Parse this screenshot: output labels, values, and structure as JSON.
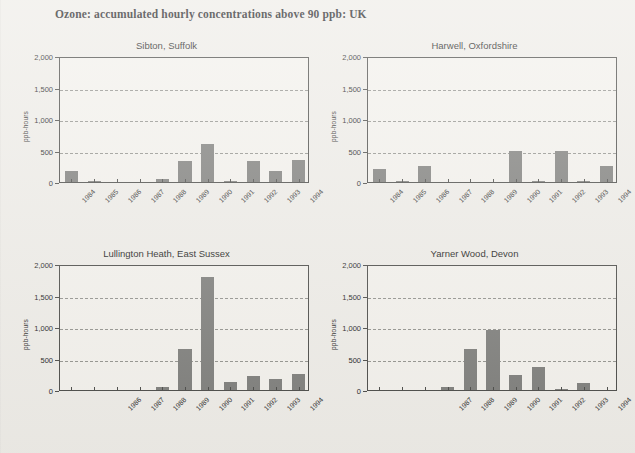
{
  "figure": {
    "title": "Ozone: accumulated hourly concentrations above 90 ppb: UK",
    "footnote": "",
    "bar_color": "#7e7e7b",
    "axis_color": "#4a4a47",
    "grid_color": "#8d8d88",
    "background": "#eeece7"
  },
  "axis": {
    "ylabel": "ppb-hours",
    "ytick_labels": [
      "0",
      "500",
      "1,000",
      "1,500",
      "2,000"
    ],
    "ymin": 0,
    "ymax": 2000
  },
  "chart_data": [
    {
      "type": "bar",
      "title": "Sibton, Suffolk",
      "xlabel": "",
      "ylabel": "ppb-hours",
      "ylim": [
        0,
        2000
      ],
      "grid": true,
      "categories": [
        "1984",
        "1985",
        "1986",
        "1987",
        "1988",
        "1989",
        "1990",
        "1991",
        "1992",
        "1993",
        "1994"
      ],
      "values": [
        170,
        5,
        0,
        0,
        40,
        330,
        600,
        5,
        340,
        170,
        350
      ],
      "visible_tick_labels": [
        "1984",
        "1985",
        "1986",
        "1987",
        "1988",
        "1989",
        "1990",
        "1991",
        "1992",
        "1993",
        "1994"
      ]
    },
    {
      "type": "bar",
      "title": "Harwell, Oxfordshire",
      "xlabel": "",
      "ylabel": "ppb-hours",
      "ylim": [
        0,
        2000
      ],
      "grid": true,
      "categories": [
        "1984",
        "1985",
        "1986",
        "1987",
        "1988",
        "1989",
        "1990",
        "1991",
        "1992",
        "1993",
        "1994"
      ],
      "values": [
        200,
        10,
        250,
        0,
        0,
        0,
        490,
        10,
        490,
        10,
        260
      ],
      "visible_tick_labels": [
        "1984",
        "1985",
        "1986",
        "1987",
        "1988",
        "1989",
        "1990",
        "1991",
        "1992",
        "1993",
        "1994"
      ]
    },
    {
      "type": "bar",
      "title": "Lullington Heath, East Sussex",
      "xlabel": "",
      "ylabel": "ppb-hours",
      "ylim": [
        0,
        2000
      ],
      "grid": true,
      "categories": [
        "1984",
        "1985",
        "1986",
        "1987",
        "1988",
        "1989",
        "1990",
        "1991",
        "1992",
        "1993",
        "1994"
      ],
      "values": [
        0,
        0,
        0,
        0,
        50,
        650,
        1800,
        120,
        220,
        170,
        250
      ],
      "visible_tick_labels": [
        "",
        "",
        "1986",
        "1987",
        "1988",
        "1989",
        "1990",
        "1991",
        "1992",
        "1993",
        "1994"
      ]
    },
    {
      "type": "bar",
      "title": "Yarner Wood, Devon",
      "xlabel": "",
      "ylabel": "ppb-hours",
      "ylim": [
        0,
        2000
      ],
      "grid": true,
      "categories": [
        "1984",
        "1985",
        "1986",
        "1987",
        "1988",
        "1989",
        "1990",
        "1991",
        "1992",
        "1993",
        "1994"
      ],
      "values": [
        0,
        0,
        0,
        50,
        650,
        950,
        240,
        370,
        10,
        110,
        0
      ],
      "visible_tick_labels": [
        "",
        "",
        "",
        "1987",
        "1988",
        "1989",
        "1990",
        "1991",
        "1992",
        "1993",
        "1994"
      ]
    }
  ]
}
